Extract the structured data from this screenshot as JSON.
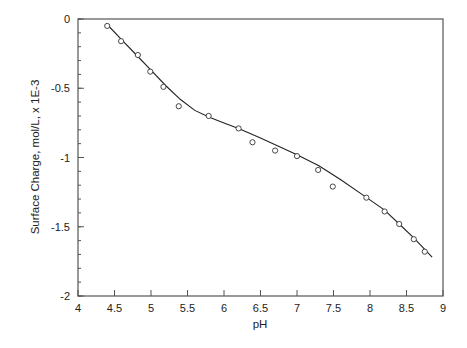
{
  "chart_data": {
    "type": "scatter",
    "title": "",
    "xlabel": "pH",
    "ylabel": "Surface Charge,  mol/L, x 1E-3",
    "xlim": [
      4,
      9
    ],
    "ylim": [
      -2,
      0
    ],
    "x_ticks": [
      4,
      4.5,
      5,
      5.5,
      6,
      6.5,
      7,
      7.5,
      8,
      8.5,
      9
    ],
    "x_tick_labels": [
      "4",
      "4.5",
      "5",
      "5.5",
      "6",
      "6.5",
      "7",
      "7.5",
      "8",
      "8.5",
      "9"
    ],
    "y_ticks": [
      0,
      -0.5,
      -1,
      -1.5,
      -2
    ],
    "y_tick_labels": [
      "0",
      "-0.5",
      "-1",
      "-1.5",
      "-2"
    ],
    "y_minor_step": 0.1,
    "grid": false,
    "legend": null,
    "series": [
      {
        "name": "Measured",
        "style": "open-circle-markers",
        "x": [
          4.4,
          4.59,
          4.82,
          4.99,
          5.17,
          5.38,
          5.79,
          6.2,
          6.39,
          6.7,
          7.0,
          7.29,
          7.49,
          7.95,
          8.2,
          8.4,
          8.6,
          8.75
        ],
        "y": [
          -0.05,
          -0.16,
          -0.26,
          -0.38,
          -0.49,
          -0.63,
          -0.7,
          -0.79,
          -0.89,
          -0.95,
          -0.99,
          -1.09,
          -1.21,
          -1.29,
          -1.39,
          -1.48,
          -1.59,
          -1.68
        ]
      },
      {
        "name": "Model fit",
        "style": "solid-line",
        "x": [
          4.4,
          4.6,
          4.8,
          5.0,
          5.2,
          5.4,
          5.6,
          5.8,
          6.0,
          6.2,
          6.5,
          7.0,
          7.3,
          7.6,
          7.9,
          8.2,
          8.4,
          8.6,
          8.85
        ],
        "y": [
          -0.04,
          -0.15,
          -0.26,
          -0.37,
          -0.48,
          -0.58,
          -0.66,
          -0.71,
          -0.75,
          -0.79,
          -0.86,
          -0.98,
          -1.06,
          -1.16,
          -1.27,
          -1.38,
          -1.48,
          -1.58,
          -1.72
        ]
      }
    ]
  }
}
